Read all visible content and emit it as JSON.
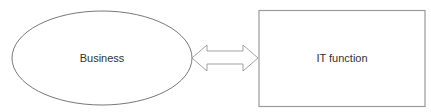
{
  "diagram": {
    "nodes": [
      {
        "id": "business",
        "shape": "ellipse",
        "label": "Business"
      },
      {
        "id": "it_function",
        "shape": "rectangle",
        "label": "IT function"
      }
    ],
    "edges": [
      {
        "from": "business",
        "to": "it_function",
        "type": "double-headed-block-arrow"
      }
    ],
    "colors": {
      "ellipse_stroke": "#555555",
      "rect_stroke": "#9a9a9a",
      "arrow_stroke": "#8a8a8a",
      "text": "#333333"
    }
  }
}
